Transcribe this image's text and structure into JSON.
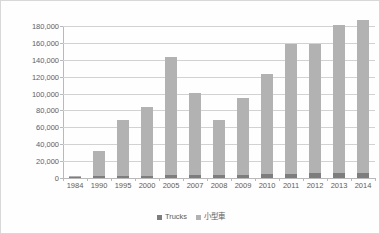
{
  "chart_data": {
    "type": "bar",
    "subtype": "stacked-column",
    "title": "",
    "xlabel": "",
    "ylabel": "",
    "ylim": [
      0,
      180000
    ],
    "ytick_step": 20000,
    "ytick_labels": [
      "180,000",
      "160,000",
      "140,000",
      "120,000",
      "100,000",
      "80,000",
      "60,000",
      "40,000",
      "20,000",
      "0"
    ],
    "ytick_values": [
      180000,
      160000,
      140000,
      120000,
      100000,
      80000,
      60000,
      40000,
      20000,
      0
    ],
    "grid": true,
    "legend_position": "bottom-center",
    "categories": [
      "1984",
      "1990",
      "1995",
      "2000",
      "2005",
      "2007",
      "2008",
      "2009",
      "2010",
      "2011",
      "2012",
      "2013",
      "2014"
    ],
    "series": [
      {
        "name": "Trucks",
        "color": "#7d7d7d",
        "values": [
          500,
          2200,
          2600,
          2800,
          3200,
          3000,
          3000,
          3400,
          4800,
          5200,
          5400,
          5600,
          6000
        ]
      },
      {
        "name": "小型車",
        "color": "#b2b2b2",
        "values": [
          1000,
          29800,
          65900,
          81200,
          139800,
          98000,
          66000,
          91600,
          118700,
          153800,
          153600,
          175400,
          181000
        ]
      }
    ],
    "totals": [
      1500,
      32000,
      68500,
      84000,
      143000,
      101000,
      69000,
      95000,
      123500,
      159000,
      159000,
      181000,
      187000
    ]
  },
  "legend": {
    "items": [
      {
        "label": "Trucks",
        "color": "#7d7d7d"
      },
      {
        "label": "小型車",
        "color": "#b2b2b2"
      }
    ]
  },
  "colors": {
    "trucks": "#7d7d7d",
    "cars": "#b2b2b2",
    "gridline": "#d2d2d2",
    "axis": "#b9b9b9",
    "text": "#5d5d5d",
    "background": "#ffffff"
  }
}
